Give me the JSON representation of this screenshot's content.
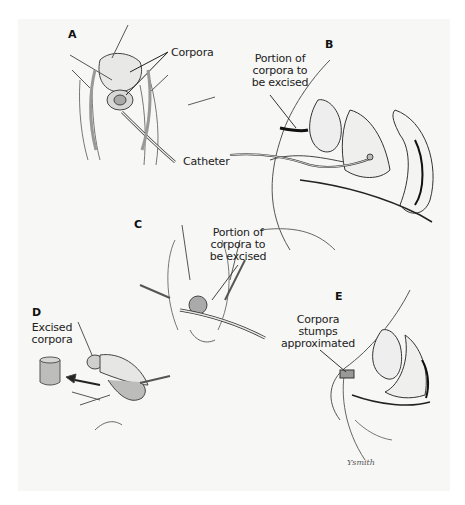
{
  "figure": {
    "panels": [
      {
        "id": "A",
        "letter": "A",
        "labels": [
          "Corpora",
          "Catheter"
        ]
      },
      {
        "id": "B",
        "letter": "B",
        "labels": [
          "Portion of corpora to be excised"
        ]
      },
      {
        "id": "C",
        "letter": "C",
        "labels": [
          "Portion of corpora to be excised"
        ]
      },
      {
        "id": "D",
        "letter": "D",
        "labels": [
          "Excised corpora"
        ]
      },
      {
        "id": "E",
        "letter": "E",
        "labels": [
          "Corpora stumps approximated"
        ]
      }
    ],
    "text": {
      "a_letter": "A",
      "a_corpora": "Corpora",
      "catheter": "Catheter",
      "b_letter": "B",
      "b_label_1": "Portion of",
      "b_label_2": "corpora to",
      "b_label_3": "be excised",
      "c_letter": "C",
      "c_label_1": "Portion of",
      "c_label_2": "corpora to",
      "c_label_3": "be excised",
      "d_letter": "D",
      "d_label_1": "Excised",
      "d_label_2": "corpora",
      "e_letter": "E",
      "e_label_1": "Corpora",
      "e_label_2": "stumps",
      "e_label_3": "approximated",
      "signature": "Ysmith"
    },
    "colors": {
      "background": "#f7f7f5",
      "ink": "#222222",
      "shade": "#9a9a9a"
    }
  }
}
